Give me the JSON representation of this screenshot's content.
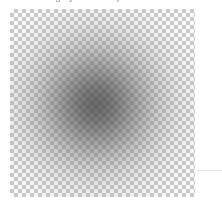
{
  "canvas": {
    "label": "transparency-canvas",
    "width_px": 185,
    "height_px": 188,
    "offset_x_px": 10,
    "offset_y_px": 9,
    "background_mode": "transparent",
    "checker": {
      "square_size_px": 4,
      "light_color": "#ffffff",
      "dark_color": "#cccccc"
    }
  },
  "caption": {
    "clipped_text": "grayscale blur preview"
  },
  "layers": {
    "blob": {
      "name": "soft radial gradient blob",
      "shape": "radial",
      "center_x_px": 95,
      "center_y_px": 105,
      "peak_color": "#3c3c3c",
      "peak_opacity": "0.66",
      "edge_opacity": "0.00",
      "blur_px": 6
    },
    "rule": {
      "name": "hairline rule",
      "color": "#e6e6e6"
    }
  }
}
